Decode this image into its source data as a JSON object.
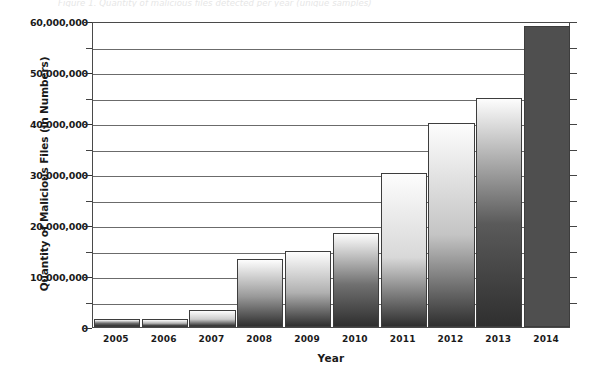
{
  "clipped_caption": "Figure 1. Quantity of malicious files detected per year (unique samples)",
  "chart_data": {
    "type": "bar",
    "title": "",
    "xlabel": "Year",
    "ylabel": "Quantity of Malicious Files (in Numbers)",
    "categories": [
      "2005",
      "2006",
      "2007",
      "2008",
      "2009",
      "2010",
      "2011",
      "2012",
      "2013",
      "2014"
    ],
    "values": [
      1500000,
      1600000,
      3300000,
      13400000,
      15000000,
      18500000,
      30200000,
      40000000,
      45000000,
      59000000
    ],
    "series": [
      {
        "name": "Quantity of Malicious Files",
        "values": [
          1500000,
          1600000,
          3300000,
          13400000,
          15000000,
          18500000,
          30200000,
          40000000,
          45000000,
          59000000
        ]
      }
    ],
    "ylim": [
      0,
      60000000
    ],
    "y_major_ticks": [
      0,
      10000000,
      20000000,
      30000000,
      40000000,
      50000000,
      60000000
    ],
    "y_major_tick_labels": [
      "0",
      "10,000,000",
      "20,000,000",
      "30,000,000",
      "40,000,000",
      "50,000,000",
      "60,000,000"
    ],
    "y_minor_ticks": [
      5000000,
      15000000,
      25000000,
      35000000,
      45000000,
      55000000
    ],
    "grid": true,
    "grid_axis": "y",
    "legend": false,
    "legend_position": "none",
    "bar_colors": [
      "#6e6e6e",
      "#b4b4b4",
      "#cccccc",
      "#9a9a9a",
      "#b0b0b0",
      "#707070",
      "#d8d8d8",
      "#c4c4c4",
      "#5a5a5a",
      "#4f4f4f"
    ],
    "bar_style": "vertical-gradient-light-top-dark-bottom",
    "bar_edge_color": "#3d3d3d",
    "axis_color": "#4a4a4a",
    "grid_color": "#6b6b6b",
    "background": "#ffffff"
  }
}
